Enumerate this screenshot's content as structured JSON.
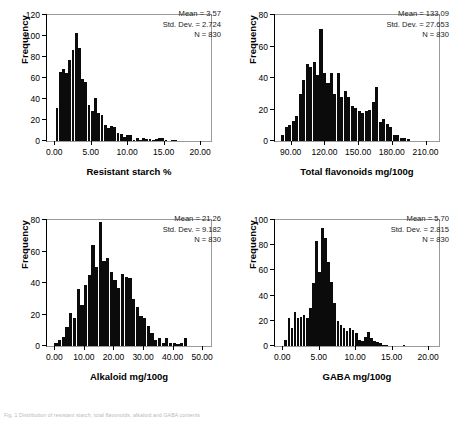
{
  "caption": "Fig. 1 Distribution of resistant starch, total flavonoids, alkaloid and GABA contents",
  "colors": {
    "bar": "#0b0b0b",
    "axis": "#000000",
    "frame": "#9a9a9a",
    "text": "#000000"
  },
  "chart_data": [
    {
      "id": "resistant-starch",
      "type": "bar",
      "title": "",
      "xlabel": "Resistant starch %",
      "ylabel": "Frequency",
      "xlim": [
        -1.0,
        21.5
      ],
      "ylim": [
        0,
        120
      ],
      "xticks": [
        0,
        5,
        10,
        15,
        20
      ],
      "xtick_labels": [
        "0.00",
        "5.00",
        "10.00",
        "15.00",
        "20.00"
      ],
      "yticks": [
        0,
        20,
        40,
        60,
        80,
        100,
        120
      ],
      "ytick_labels": [
        "0",
        "20",
        "40",
        "60",
        "80",
        "100",
        "120"
      ],
      "grid": false,
      "bin_width": 0.44,
      "bin_starts": [
        0.18,
        0.62,
        1.06,
        1.5,
        1.94,
        2.38,
        2.82,
        3.26,
        3.7,
        4.14,
        4.58,
        5.02,
        5.46,
        5.9,
        6.34,
        6.78,
        7.22,
        7.66,
        8.1,
        8.54,
        8.98,
        9.42,
        9.86,
        10.3,
        10.74,
        11.18,
        11.62,
        12.06,
        12.5,
        12.94,
        13.38,
        13.82,
        14.26,
        14.7,
        15.14,
        15.58,
        16.02,
        16.46,
        16.9
      ],
      "values": [
        31,
        66,
        69,
        65,
        77,
        87,
        103,
        89,
        59,
        56,
        34,
        29,
        41,
        27,
        25,
        15,
        12,
        14,
        13,
        8,
        7,
        4,
        6,
        6,
        1,
        3,
        1,
        3,
        2,
        2,
        1,
        2,
        3,
        3,
        1,
        0,
        1,
        1,
        0
      ],
      "annotations": {
        "mean_label": "Mean = 3.57",
        "sd_label": "Std. Dev. = 2.724",
        "n_label": "N = 830"
      }
    },
    {
      "id": "total-flavonoids",
      "type": "bar",
      "title": "",
      "xlabel": "Total flavonoids mg/100g",
      "ylabel": "Frequency",
      "xlim": [
        76,
        222
      ],
      "ylim": [
        0,
        80
      ],
      "xticks": [
        90,
        120,
        150,
        180,
        210
      ],
      "xtick_labels": [
        "90.00",
        "120.00",
        "150.00",
        "180.00",
        "210.00"
      ],
      "yticks": [
        0,
        20,
        40,
        60,
        80
      ],
      "ytick_labels": [
        "0",
        "20",
        "40",
        "60",
        "80"
      ],
      "grid": false,
      "bin_width": 3.1,
      "bin_starts": [
        81.5,
        84.6,
        87.7,
        90.8,
        93.9,
        97.0,
        100.1,
        103.2,
        106.3,
        109.4,
        112.5,
        115.6,
        118.7,
        121.8,
        124.9,
        128.0,
        131.1,
        134.2,
        137.3,
        140.4,
        143.5,
        146.6,
        149.7,
        152.8,
        155.9,
        159.0,
        162.1,
        165.2,
        168.3,
        171.4,
        174.5,
        177.6,
        180.7,
        183.8,
        186.9,
        190.0,
        193.1,
        196.2,
        199.3,
        202.4,
        205.5,
        208.6
      ],
      "values": [
        4,
        9,
        10,
        13,
        16,
        30,
        39,
        49,
        47,
        50,
        42,
        71,
        43,
        37,
        43,
        30,
        43,
        28,
        32,
        28,
        22,
        21,
        19,
        18,
        19,
        20,
        25,
        34,
        12,
        14,
        11,
        9,
        4,
        4,
        2,
        2,
        1,
        0,
        0,
        0,
        0,
        0
      ],
      "annotations": {
        "mean_label": "Mean = 133.09",
        "sd_label": "Std. Dev. = 27.653",
        "n_label": "N = 830"
      }
    },
    {
      "id": "alkaloid",
      "type": "bar",
      "title": "",
      "xlabel": "Alkaloid mg/100g",
      "ylabel": "Frequency",
      "xlim": [
        -2.5,
        53
      ],
      "ylim": [
        0,
        80
      ],
      "xticks": [
        0,
        10,
        20,
        30,
        40,
        50
      ],
      "xtick_labels": [
        "0.00",
        "10.00",
        "20.00",
        "30.00",
        "40.00",
        "50.00"
      ],
      "yticks": [
        0,
        20,
        40,
        60,
        80
      ],
      "ytick_labels": [
        "0",
        "20",
        "40",
        "60",
        "80"
      ],
      "grid": false,
      "bin_width": 1.25,
      "bin_starts": [
        0.0,
        1.25,
        2.5,
        3.75,
        5.0,
        6.25,
        7.5,
        8.75,
        10.0,
        11.25,
        12.5,
        13.75,
        15.0,
        16.25,
        17.5,
        18.75,
        20.0,
        21.25,
        22.5,
        23.75,
        25.0,
        26.25,
        27.5,
        28.75,
        30.0,
        31.25,
        32.5,
        33.75,
        35.0,
        36.25,
        37.5,
        38.75,
        40.0,
        41.25,
        42.5,
        43.75,
        45.0,
        46.25,
        47.5,
        48.75
      ],
      "values": [
        2,
        4,
        6,
        12,
        21,
        18,
        36,
        26,
        39,
        45,
        64,
        50,
        79,
        54,
        56,
        47,
        42,
        37,
        46,
        44,
        43,
        30,
        25,
        19,
        18,
        13,
        8,
        4,
        5,
        2,
        5,
        2,
        2,
        1,
        2,
        5
      ],
      "annotations": {
        "mean_label": "Mean = 21.26",
        "sd_label": "Std. Dev. = 9.182",
        "n_label": "N = 830"
      }
    },
    {
      "id": "gaba",
      "type": "bar",
      "title": "",
      "xlabel": "GABA mg/100g",
      "ylabel": "Frequency",
      "xlim": [
        -1.0,
        21.5
      ],
      "ylim": [
        0,
        100
      ],
      "xticks": [
        0,
        5,
        10,
        15,
        20
      ],
      "xtick_labels": [
        "0.00",
        "5.00",
        "10.00",
        "15.00",
        "20.00"
      ],
      "yticks": [
        0,
        20,
        40,
        60,
        80,
        100
      ],
      "ytick_labels": [
        "0",
        "20",
        "40",
        "60",
        "80",
        "100"
      ],
      "grid": false,
      "bin_width": 0.42,
      "bin_starts": [
        0.3,
        0.72,
        1.14,
        1.56,
        1.98,
        2.4,
        2.82,
        3.24,
        3.66,
        4.08,
        4.5,
        4.92,
        5.34,
        5.76,
        6.18,
        6.6,
        7.02,
        7.44,
        7.86,
        8.28,
        8.7,
        9.12,
        9.54,
        9.96,
        10.38,
        10.8,
        11.22,
        11.64,
        12.06,
        12.48,
        12.9,
        13.32,
        13.74,
        14.16,
        14.58,
        15.0,
        15.42,
        16.5,
        17.2
      ],
      "values": [
        5,
        22,
        14,
        27,
        22,
        23,
        25,
        22,
        30,
        50,
        83,
        59,
        94,
        86,
        67,
        51,
        34,
        20,
        17,
        14,
        12,
        14,
        13,
        10,
        5,
        4,
        7,
        11,
        6,
        4,
        3,
        2,
        1,
        1,
        0,
        0,
        0,
        1,
        0
      ],
      "annotations": {
        "mean_label": "Mean = 5.70",
        "sd_label": "Std. Dev. = 2.815",
        "n_label": "N = 830"
      }
    }
  ]
}
